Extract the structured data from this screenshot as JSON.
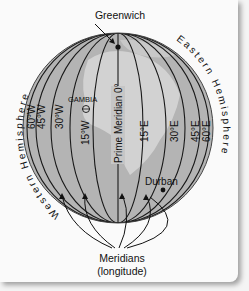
{
  "diagram": {
    "title_label": "Greenwich",
    "place_labels": {
      "gambia": "GAMBIA",
      "durban": "Durban"
    },
    "prime_meridian_label": "Prime Meridian 0°",
    "west_labels": [
      "60°W",
      "45°W",
      "30°W",
      "15°W"
    ],
    "east_labels": [
      "15°E",
      "30°E",
      "45°E",
      "60°E"
    ],
    "hemispheres": {
      "western": "Western Hemisphere",
      "eastern": "Eastern Hemisphere"
    },
    "callout": {
      "line1": "Meridians",
      "line2": "(longitude)"
    },
    "colors": {
      "globe": "#b4b4b4",
      "land": "#cfcfcf",
      "lines": "#1a1a1a",
      "background": "#fafafa"
    }
  }
}
